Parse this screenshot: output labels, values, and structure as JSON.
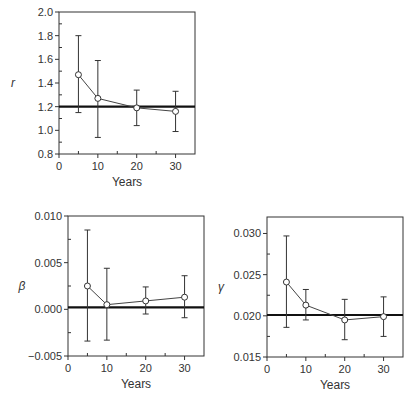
{
  "chart_data": [
    {
      "id": "r",
      "type": "line",
      "title": "",
      "xlabel": "Years",
      "ylabel": "r",
      "xlim": [
        0,
        35
      ],
      "ylim": [
        0.8,
        2.0
      ],
      "xticks": [
        0,
        10,
        20,
        30
      ],
      "xtick_labels": [
        "0",
        "10",
        "20",
        "30"
      ],
      "yticks": [
        0.8,
        1.0,
        1.2,
        1.4,
        1.6,
        1.8,
        2.0
      ],
      "ytick_labels": [
        "0.8",
        "1.0",
        "1.2",
        "1.4",
        "1.6",
        "1.8",
        "2.0"
      ],
      "x": [
        5,
        10,
        20,
        30
      ],
      "values": [
        1.47,
        1.27,
        1.19,
        1.16
      ],
      "err_low": [
        1.15,
        0.94,
        1.04,
        0.99
      ],
      "err_high": [
        1.8,
        1.59,
        1.34,
        1.33
      ],
      "reference_line": 1.2,
      "grid": false,
      "legend": null
    },
    {
      "id": "beta",
      "type": "line",
      "title": "",
      "xlabel": "Years",
      "ylabel": "β",
      "xlim": [
        0,
        35
      ],
      "ylim": [
        -0.005,
        0.01
      ],
      "xticks": [
        0,
        10,
        20,
        30
      ],
      "xtick_labels": [
        "0",
        "10",
        "20",
        "30"
      ],
      "yticks": [
        -0.005,
        0.0,
        0.005,
        0.01
      ],
      "ytick_labels": [
        "−0.005",
        "0.000",
        "0.005",
        "0.010"
      ],
      "x": [
        5,
        10,
        20,
        30
      ],
      "values": [
        0.0025,
        0.0005,
        0.0009,
        0.0013
      ],
      "err_low": [
        -0.0034,
        -0.0033,
        -0.0005,
        -0.0009
      ],
      "err_high": [
        0.0085,
        0.0044,
        0.0024,
        0.0036
      ],
      "reference_line": 0.0002,
      "grid": false,
      "legend": null
    },
    {
      "id": "gamma",
      "type": "line",
      "title": "",
      "xlabel": "Years",
      "ylabel": "γ",
      "xlim": [
        0,
        35
      ],
      "ylim": [
        0.015,
        0.032
      ],
      "xticks": [
        0,
        10,
        20,
        30
      ],
      "xtick_labels": [
        "0",
        "10",
        "20",
        "30"
      ],
      "yticks": [
        0.015,
        0.02,
        0.025,
        0.03
      ],
      "ytick_labels": [
        "0.015",
        "0.020",
        "0.025",
        "0.030"
      ],
      "x": [
        5,
        10,
        20,
        30
      ],
      "values": [
        0.0241,
        0.0213,
        0.0195,
        0.0199
      ],
      "err_low": [
        0.0186,
        0.0195,
        0.0171,
        0.0175
      ],
      "err_high": [
        0.0297,
        0.0232,
        0.022,
        0.0223
      ],
      "reference_line": 0.0201,
      "grid": false,
      "legend": null
    }
  ],
  "layout": [
    {
      "left": 59,
      "top": 12,
      "width": 136,
      "height": 142
    },
    {
      "left": 68,
      "top": 216,
      "width": 136,
      "height": 140
    },
    {
      "left": 267,
      "top": 217,
      "width": 136,
      "height": 140
    }
  ],
  "colors": {
    "axis": "#333333",
    "line": "#444444",
    "reference": "#111111",
    "marker_fill": "#ffffff"
  }
}
